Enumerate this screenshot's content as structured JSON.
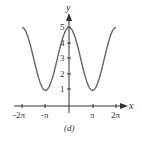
{
  "caption": "(d)",
  "chart_data": {
    "type": "line",
    "title": "",
    "xlabel": "x",
    "ylabel": "y",
    "function": "y = 3 + 2cos(x)",
    "x_ticks": [
      "-2π",
      "-π",
      "π",
      "2π"
    ],
    "x_tick_values": [
      -6.2832,
      -3.1416,
      3.1416,
      6.2832
    ],
    "y_ticks": [
      "1",
      "2",
      "3",
      "4",
      "5"
    ],
    "y_tick_values": [
      1,
      2,
      3,
      4,
      5
    ],
    "xlim": [
      -6.2832,
      6.2832
    ],
    "ylim": [
      0,
      5
    ],
    "grid": false,
    "legend": null,
    "series": [
      {
        "name": "curve",
        "x": [
          -6.2832,
          -4.7124,
          -3.1416,
          -1.5708,
          0,
          1.5708,
          3.1416,
          4.7124,
          6.2832
        ],
        "y": [
          5,
          3,
          1,
          3,
          5,
          3,
          1,
          3,
          5
        ]
      }
    ],
    "colors": {
      "curve": "#666666",
      "axes": "#333333"
    }
  }
}
